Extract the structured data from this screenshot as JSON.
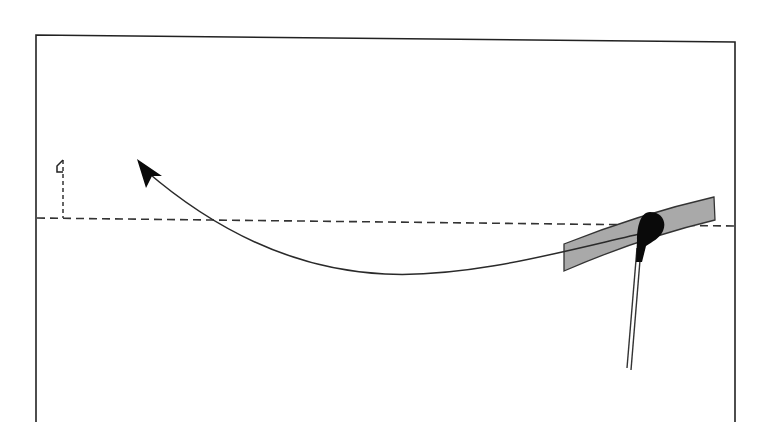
{
  "diagram": {
    "type": "golf-ball-flight-path",
    "colors": {
      "background": "#ffffff",
      "line": "#2a2a2a",
      "frame": "#222222",
      "band_fill": "#a9a9a9",
      "band_stroke": "#333333",
      "ball": "#0a0a0a"
    },
    "elements": {
      "frame": "border-frame",
      "target_line": "dashed-target-line",
      "flag": "flag-icon",
      "flight_path": "curved-ball-flight-path",
      "arrowhead": "arrowhead-icon",
      "swing_band": "club-swing-path-band",
      "ball": "golf-ball",
      "club_shaft": "club-shaft"
    }
  }
}
